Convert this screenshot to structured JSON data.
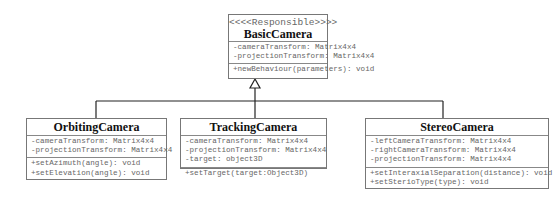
{
  "diagram_type": "UML class diagram",
  "parent": {
    "stereotype": "<<<<Responsible>>>>",
    "name": "BasicCamera",
    "attributes": [
      "-cameraTransform: Matrix4x4",
      "-projectionTransform: Matrix4x4"
    ],
    "methods": [
      "+newBehaviour(parameters): void"
    ]
  },
  "children": [
    {
      "name": "OrbitingCamera",
      "attributes": [
        "-cameraTransform: Matrix4x4",
        "-projectionTransform: Matrix4x4"
      ],
      "methods": [
        "+setAzimuth(angle): void",
        "+setElevation(angle): void"
      ]
    },
    {
      "name": "TrackingCamera",
      "attributes": [
        "-cameraTransform: Matrix4x4",
        "-projectionTransform: Matrix4x4",
        "-target: object3D"
      ],
      "methods": [
        "+setTarget(target:Object3D)"
      ]
    },
    {
      "name": "StereoCamera",
      "attributes": [
        "-leftCameraTransform: Matrix4x4",
        "-rightCameraTransform: Matrix4x4",
        "-projectionTransform: Matrix4x4"
      ],
      "methods": [
        "+setInteraxialSeparation(distance): void",
        "+setSterioType(type): void"
      ]
    }
  ],
  "relationships": [
    {
      "type": "generalization",
      "from": "OrbitingCamera",
      "to": "BasicCamera"
    },
    {
      "type": "generalization",
      "from": "TrackingCamera",
      "to": "BasicCamera"
    },
    {
      "type": "generalization",
      "from": "StereoCamera",
      "to": "BasicCamera"
    }
  ]
}
